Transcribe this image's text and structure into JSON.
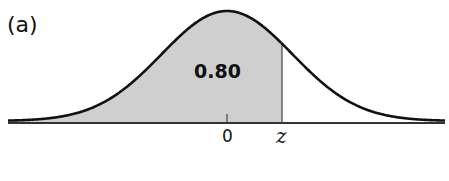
{
  "panel_label": "(a)",
  "area_label": "0.80",
  "ticks": {
    "zero": "0",
    "z": "z"
  },
  "colors": {
    "curve": "#111111",
    "shade": "#cfcfcf",
    "axis": "#333333"
  },
  "chart_data": {
    "type": "area",
    "title": "(a)",
    "distribution": "standard normal",
    "shaded_region": {
      "from": "-inf",
      "to": "z",
      "area": 0.8
    },
    "annotations": [
      "0.80"
    ],
    "x_tick_labels": [
      "0",
      "z"
    ],
    "z_value_implied": 0.84,
    "xlabel": "",
    "ylabel": "",
    "grid": false,
    "legend": "none"
  }
}
